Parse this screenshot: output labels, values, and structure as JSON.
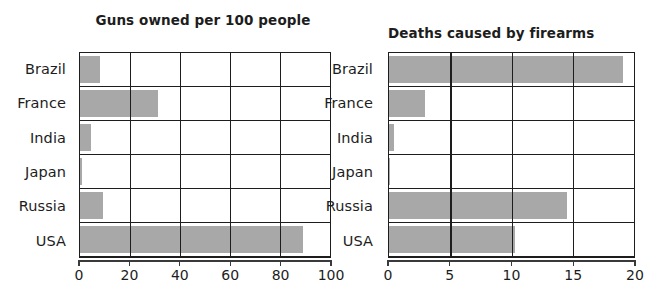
{
  "chart_data": [
    {
      "id": "guns-owned",
      "type": "bar",
      "orientation": "horizontal",
      "title": "Guns owned per 100 people",
      "xlabel": "",
      "ylabel": "",
      "categories": [
        "Brazil",
        "France",
        "India",
        "Japan",
        "Russia",
        "USA"
      ],
      "values": [
        8,
        31,
        4.5,
        0.6,
        9,
        89
      ],
      "xlim": [
        0,
        100
      ],
      "xticks": [
        0,
        20,
        40,
        60,
        80,
        100
      ],
      "xticklabels": [
        "0",
        "20",
        "40",
        "60",
        "80",
        "100"
      ],
      "grid": "vertical",
      "legend": "none",
      "bar_color": "#a8a8a8",
      "axis_color": "#1d1d1d"
    },
    {
      "id": "firearm-deaths",
      "type": "bar",
      "orientation": "horizontal",
      "title": "Deaths caused by firearms\n(per 100,000 people)",
      "title_line1": "Deaths caused by firearms",
      "title_line2": "(per 100,000 people)",
      "xlabel": "",
      "ylabel": "",
      "categories": [
        "Brazil",
        "France",
        "India",
        "Japan",
        "Russia",
        "USA"
      ],
      "values": [
        19.1,
        2.9,
        0.4,
        0.1,
        14.5,
        10.3
      ],
      "xlim": [
        0,
        20
      ],
      "xticks": [
        0,
        5,
        10,
        15,
        20
      ],
      "xticklabels": [
        "0",
        "5",
        "10",
        "15",
        "20"
      ],
      "grid": "vertical",
      "legend": "none",
      "bar_color": "#a8a8a8",
      "axis_color": "#1d1d1d"
    }
  ]
}
